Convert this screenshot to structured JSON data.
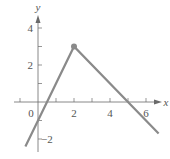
{
  "chart_data": {
    "type": "line",
    "title": "",
    "xlabel": "x",
    "ylabel": "y",
    "xlim": [
      -1,
      7
    ],
    "ylim": [
      -2.8,
      4.6
    ],
    "x_ticks": [
      -1,
      0,
      1,
      2,
      3,
      4,
      5,
      6
    ],
    "x_tick_labels": [
      "0",
      "2",
      "4",
      "6"
    ],
    "x_tick_label_values": [
      0,
      2,
      4,
      6
    ],
    "y_ticks": [
      -2,
      -1,
      1,
      2,
      3,
      4
    ],
    "y_tick_labels": [
      "4",
      "2",
      "−2"
    ],
    "y_tick_label_values": [
      4,
      2,
      -2
    ],
    "grid": false,
    "series": [
      {
        "name": "piecewise-linear",
        "x": [
          -0.7,
          2,
          6.7
        ],
        "y": [
          -2.4,
          3,
          -1.7
        ],
        "marker_point": {
          "x": 2,
          "y": 3
        },
        "color": "#888888"
      }
    ]
  },
  "labels": {
    "x_axis": "x",
    "y_axis": "y",
    "origin": "0"
  },
  "colors": {
    "line": "#8a8a8a",
    "axis": "#6a6a6a",
    "text": "#555555"
  }
}
